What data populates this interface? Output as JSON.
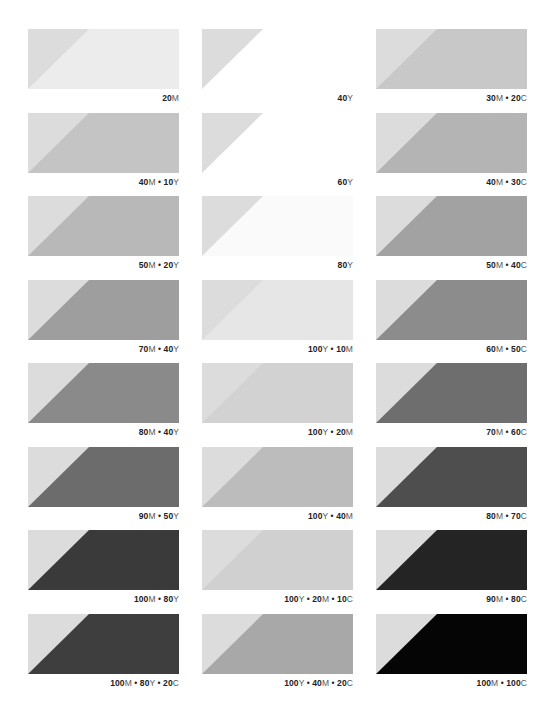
{
  "page": {
    "background": "#ffffff",
    "light_triangle_color": "#dcdcdc"
  },
  "columns_x": [
    28,
    202,
    376
  ],
  "rows_y": [
    29,
    113,
    196,
    280,
    363,
    447,
    530,
    614
  ],
  "swatches": [
    {
      "row": 0,
      "col": 0,
      "label": "20M",
      "parts": [
        {
          "n": "20",
          "u": "M"
        }
      ],
      "fill": "#ececec"
    },
    {
      "row": 0,
      "col": 1,
      "label": "40Y",
      "parts": [
        {
          "n": "40",
          "u": "Y"
        }
      ],
      "fill": "#ffffff"
    },
    {
      "row": 0,
      "col": 2,
      "label": "30M • 20C",
      "parts": [
        {
          "n": "30",
          "u": "M"
        },
        {
          "n": "20",
          "u": "C"
        }
      ],
      "fill": "#c8c8c8"
    },
    {
      "row": 1,
      "col": 0,
      "label": "40M • 10Y",
      "parts": [
        {
          "n": "40",
          "u": "M"
        },
        {
          "n": "10",
          "u": "Y"
        }
      ],
      "fill": "#c4c4c4"
    },
    {
      "row": 1,
      "col": 1,
      "label": "60Y",
      "parts": [
        {
          "n": "60",
          "u": "Y"
        }
      ],
      "fill": "#ffffff"
    },
    {
      "row": 1,
      "col": 2,
      "label": "40M • 30C",
      "parts": [
        {
          "n": "40",
          "u": "M"
        },
        {
          "n": "30",
          "u": "C"
        }
      ],
      "fill": "#b4b4b4"
    },
    {
      "row": 2,
      "col": 0,
      "label": "50M • 20Y",
      "parts": [
        {
          "n": "50",
          "u": "M"
        },
        {
          "n": "20",
          "u": "Y"
        }
      ],
      "fill": "#b8b8b8"
    },
    {
      "row": 2,
      "col": 1,
      "label": "80Y",
      "parts": [
        {
          "n": "80",
          "u": "Y"
        }
      ],
      "fill": "#fafafa"
    },
    {
      "row": 2,
      "col": 2,
      "label": "50M • 40C",
      "parts": [
        {
          "n": "50",
          "u": "M"
        },
        {
          "n": "40",
          "u": "C"
        }
      ],
      "fill": "#a2a2a2"
    },
    {
      "row": 3,
      "col": 0,
      "label": "70M • 40Y",
      "parts": [
        {
          "n": "70",
          "u": "M"
        },
        {
          "n": "40",
          "u": "Y"
        }
      ],
      "fill": "#9e9e9e"
    },
    {
      "row": 3,
      "col": 1,
      "label": "100Y • 10M",
      "parts": [
        {
          "n": "100",
          "u": "Y"
        },
        {
          "n": "10",
          "u": "M"
        }
      ],
      "fill": "#e6e6e6"
    },
    {
      "row": 3,
      "col": 2,
      "label": "60M • 50C",
      "parts": [
        {
          "n": "60",
          "u": "M"
        },
        {
          "n": "50",
          "u": "C"
        }
      ],
      "fill": "#8c8c8c"
    },
    {
      "row": 4,
      "col": 0,
      "label": "80M • 40Y",
      "parts": [
        {
          "n": "80",
          "u": "M"
        },
        {
          "n": "40",
          "u": "Y"
        }
      ],
      "fill": "#8a8a8a"
    },
    {
      "row": 4,
      "col": 1,
      "label": "100Y • 20M",
      "parts": [
        {
          "n": "100",
          "u": "Y"
        },
        {
          "n": "20",
          "u": "M"
        }
      ],
      "fill": "#d2d2d2"
    },
    {
      "row": 4,
      "col": 2,
      "label": "70M • 60C",
      "parts": [
        {
          "n": "70",
          "u": "M"
        },
        {
          "n": "60",
          "u": "C"
        }
      ],
      "fill": "#6e6e6e"
    },
    {
      "row": 5,
      "col": 0,
      "label": "90M • 50Y",
      "parts": [
        {
          "n": "90",
          "u": "M"
        },
        {
          "n": "50",
          "u": "Y"
        }
      ],
      "fill": "#6c6c6c"
    },
    {
      "row": 5,
      "col": 1,
      "label": "100Y • 40M",
      "parts": [
        {
          "n": "100",
          "u": "Y"
        },
        {
          "n": "40",
          "u": "M"
        }
      ],
      "fill": "#bcbcbc"
    },
    {
      "row": 5,
      "col": 2,
      "label": "80M • 70C",
      "parts": [
        {
          "n": "80",
          "u": "M"
        },
        {
          "n": "70",
          "u": "C"
        }
      ],
      "fill": "#4e4e4e"
    },
    {
      "row": 6,
      "col": 0,
      "label": "100M • 80Y",
      "parts": [
        {
          "n": "100",
          "u": "M"
        },
        {
          "n": "80",
          "u": "Y"
        }
      ],
      "fill": "#3a3a3a"
    },
    {
      "row": 6,
      "col": 1,
      "label": "100Y • 20M • 10C",
      "parts": [
        {
          "n": "100",
          "u": "Y"
        },
        {
          "n": "20",
          "u": "M"
        },
        {
          "n": "10",
          "u": "C"
        }
      ],
      "fill": "#d0d0d0"
    },
    {
      "row": 6,
      "col": 2,
      "label": "90M • 80C",
      "parts": [
        {
          "n": "90",
          "u": "M"
        },
        {
          "n": "80",
          "u": "C"
        }
      ],
      "fill": "#242424"
    },
    {
      "row": 7,
      "col": 0,
      "label": "100M • 80Y • 20C",
      "parts": [
        {
          "n": "100",
          "u": "M"
        },
        {
          "n": "80",
          "u": "Y"
        },
        {
          "n": "20",
          "u": "C"
        }
      ],
      "fill": "#3e3e3e"
    },
    {
      "row": 7,
      "col": 1,
      "label": "100Y • 40M • 20C",
      "parts": [
        {
          "n": "100",
          "u": "Y"
        },
        {
          "n": "40",
          "u": "M"
        },
        {
          "n": "20",
          "u": "C"
        }
      ],
      "fill": "#a8a8a8"
    },
    {
      "row": 7,
      "col": 2,
      "label": "100M • 100C",
      "parts": [
        {
          "n": "100",
          "u": "M"
        },
        {
          "n": "100",
          "u": "C"
        }
      ],
      "fill": "#050505"
    }
  ]
}
